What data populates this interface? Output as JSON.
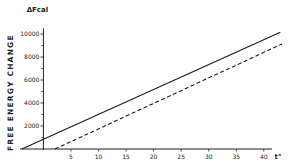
{
  "chart_data": {
    "type": "line",
    "title": "",
    "xlabel": "t°",
    "ylabel": "FREE ENERGY CHANGE",
    "yunit": "ΔFcal",
    "xlim": [
      -4,
      43
    ],
    "ylim": [
      0,
      10500
    ],
    "xticks": [
      5,
      10,
      15,
      20,
      25,
      30,
      35,
      40
    ],
    "yticks": [
      2000,
      4000,
      6000,
      8000,
      10000
    ],
    "yminor": [
      1000,
      3000,
      5000,
      7000,
      9000
    ],
    "grid": false,
    "legend": "none",
    "series": [
      {
        "name": "solid",
        "style": "solid",
        "x": [
          -3.9,
          43
        ],
        "y": [
          0,
          10150
        ]
      },
      {
        "name": "dashed",
        "style": "dashed",
        "x": [
          2.1,
          43.3
        ],
        "y": [
          0,
          9130
        ]
      }
    ]
  }
}
